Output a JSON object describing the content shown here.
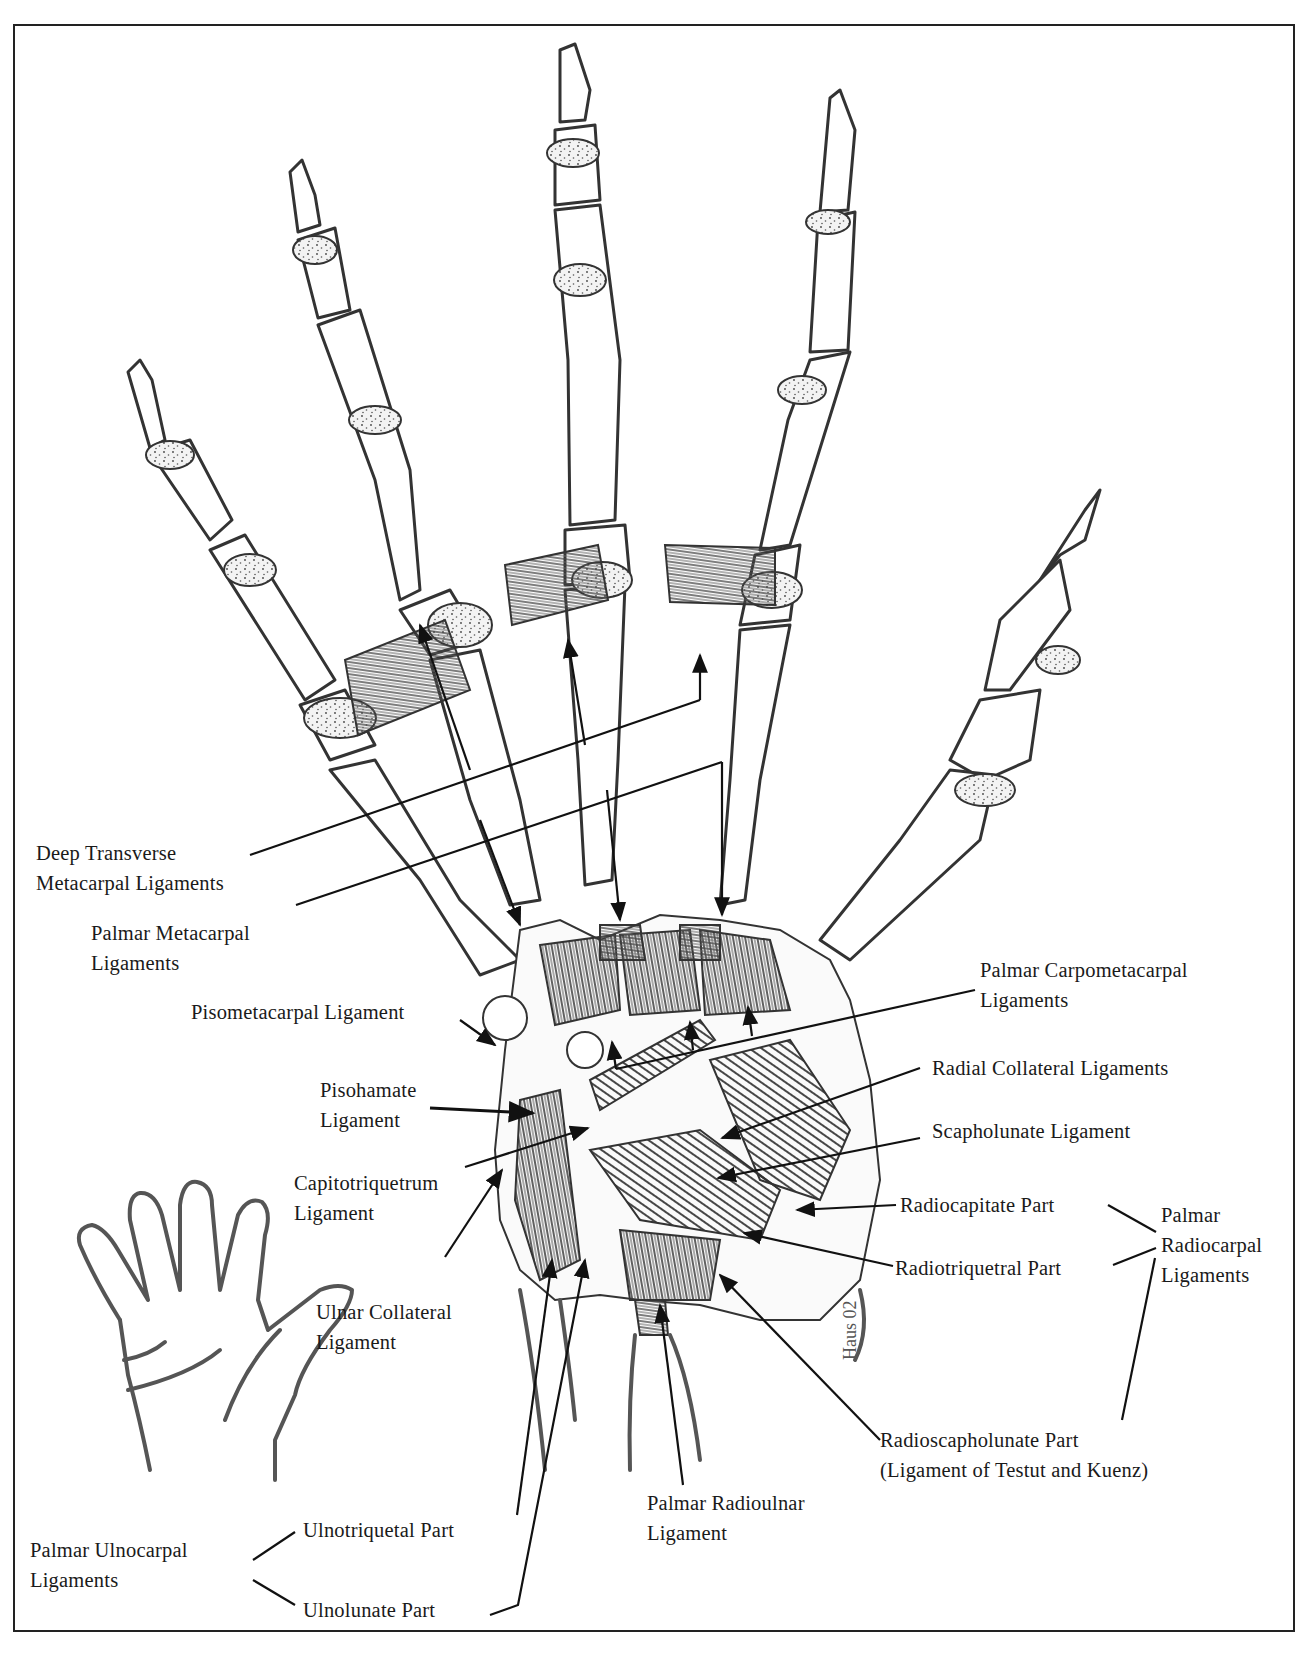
{
  "figure": {
    "type": "anatomical-illustration",
    "border_color": "#222222",
    "ink_color": "#333333"
  },
  "labels": {
    "deep_transverse": {
      "line1": "Deep Transverse",
      "line2": "Metacarpal Ligaments"
    },
    "palmar_metacarpal": {
      "line1": "Palmar Metacarpal",
      "line2": "Ligaments"
    },
    "pisometacarpal": {
      "line1": "Pisometacarpal Ligament"
    },
    "pisohamate": {
      "line1": "Pisohamate",
      "line2": "Ligament"
    },
    "capitotriquetrum": {
      "line1": "Capitotriquetrum",
      "line2": "Ligament"
    },
    "ulnar_collateral": {
      "line1": "Ulnar Collateral",
      "line2": "Ligament"
    },
    "palmar_carpometacarpal": {
      "line1": "Palmar Carpometacarpal",
      "line2": "Ligaments"
    },
    "radial_collateral": {
      "line1": "Radial Collateral Ligaments"
    },
    "scapholunate": {
      "line1": "Scapholunate Ligament"
    },
    "radiocapitate": {
      "line1": "Radiocapitate Part"
    },
    "radiotriquetral": {
      "line1": "Radiotriquetral Part"
    },
    "palmar_radiocarpal": {
      "line1": "Palmar",
      "line2": "Radiocarpal",
      "line3": "Ligaments"
    },
    "radioscapholunate": {
      "line1": "Radioscapholunate Part",
      "line2": "(Ligament of Testut and Kuenz)"
    },
    "palmar_radioulnar": {
      "line1": "Palmar Radioulnar",
      "line2": "Ligament"
    },
    "palmar_ulnocarpal": {
      "line1": "Palmar Ulnocarpal",
      "line2": "Ligaments"
    },
    "ulnotriquetal": {
      "line1": "Ulnotriquetal Part"
    },
    "ulnolunate": {
      "line1": "Ulnolunate Part"
    }
  },
  "inset": {
    "description": "Small outline of right hand, palm view",
    "name": "orientation-hand-inset"
  },
  "signature": {
    "text": "Haus 02"
  }
}
